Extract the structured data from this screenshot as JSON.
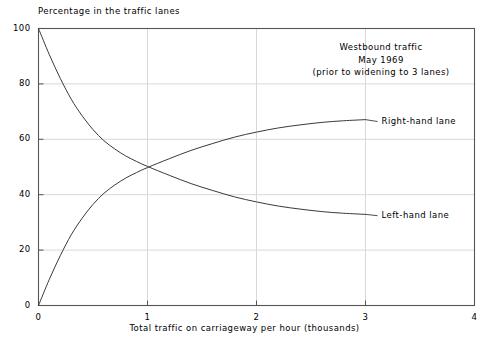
{
  "chart_data": {
    "type": "line",
    "title": "",
    "ylabel": "Percentage in the traffic lanes",
    "xlabel": "Total traffic on carriageway per hour (thousands)",
    "xlim": [
      0,
      4
    ],
    "ylim": [
      0,
      100
    ],
    "xticks": [
      "0",
      "1",
      "2",
      "3",
      "4"
    ],
    "xtick_values": [
      0,
      1,
      2,
      3,
      4
    ],
    "yticks": [
      "0",
      "20",
      "40",
      "60",
      "80",
      "100"
    ],
    "ytick_values": [
      0,
      20,
      40,
      60,
      80,
      100
    ],
    "grid": true,
    "legend_position": "inline-right-of-curve-ends",
    "annotations": [
      "Westbound traffic",
      "May 1969",
      "(prior to widening to 3 lanes)"
    ],
    "x": [
      0,
      0.1,
      0.2,
      0.3,
      0.4,
      0.5,
      0.6,
      0.7,
      0.8,
      0.9,
      1.0,
      1.2,
      1.4,
      1.6,
      1.8,
      2.0,
      2.2,
      2.4,
      2.6,
      2.8,
      3.0
    ],
    "series": [
      {
        "name": "Right-hand lane",
        "label": "Right-hand lane",
        "values": [
          0,
          9.5,
          18.0,
          25.5,
          31.5,
          36.5,
          40.5,
          43.5,
          46.0,
          48.0,
          49.8,
          53.0,
          56.0,
          58.5,
          60.8,
          62.6,
          64.1,
          65.2,
          66.1,
          66.7,
          67.1
        ],
        "color": "#3a3a3a",
        "label_x": 3.12,
        "label_y": 67.5
      },
      {
        "name": "Left-hand lane",
        "label": "Left-hand lane",
        "values": [
          100,
          90.5,
          82.0,
          74.5,
          68.5,
          63.5,
          59.5,
          56.5,
          54.0,
          52.0,
          50.2,
          47.0,
          44.0,
          41.5,
          39.2,
          37.4,
          35.9,
          34.8,
          33.9,
          33.3,
          32.9
        ],
        "color": "#3a3a3a",
        "label_x": 3.12,
        "label_y": 33.5
      }
    ]
  },
  "axes": {
    "frame_color": "#555555",
    "grid_color": "#d8d8d8",
    "background": "#ffffff"
  }
}
